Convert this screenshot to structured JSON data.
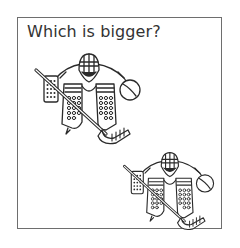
{
  "worksheet": {
    "title": "Which is bigger?",
    "border_color": "#6e6e6e",
    "ink_color": "#2a2a2a"
  },
  "figures": [
    {
      "id": "goalie-a",
      "label": "hockey goalie",
      "icon": "hockey-goalie-icon",
      "position": "upper-left"
    },
    {
      "id": "goalie-b",
      "label": "hockey goalie",
      "icon": "hockey-goalie-icon",
      "position": "lower-right"
    }
  ]
}
